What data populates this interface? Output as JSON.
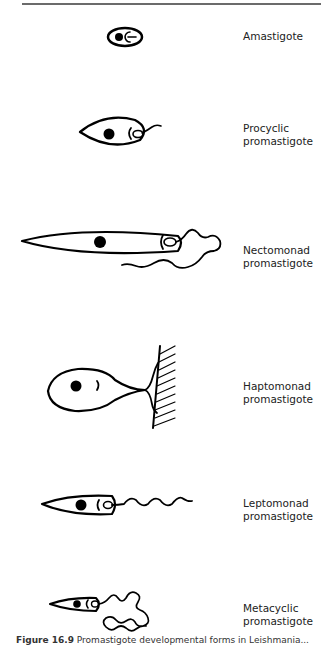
{
  "figure": {
    "stages": [
      {
        "id": "amastigote",
        "line1": "Amastigote",
        "line2": ""
      },
      {
        "id": "procyclic",
        "line1": "Procyclic",
        "line2": "promastigote"
      },
      {
        "id": "nectomonad",
        "line1": "Nectomonad",
        "line2": "promastigote"
      },
      {
        "id": "haptomonad",
        "line1": "Haptomonad",
        "line2": "promastigote"
      },
      {
        "id": "leptomonad",
        "line1": "Leptomonad",
        "line2": "promastigote"
      },
      {
        "id": "metacyclic",
        "line1": "Metacyclic",
        "line2": "promastigote"
      }
    ],
    "caption_number": "Figure 16.9",
    "caption_text": "Promastigote developmental forms in Leishmania..."
  },
  "colors": {
    "ink": "#000000",
    "text": "#222222",
    "rule": "#6b6b6b"
  }
}
